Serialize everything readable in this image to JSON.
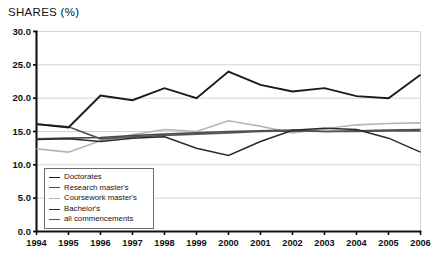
{
  "chart_title": "SHARES (%)",
  "axes": {
    "y_ticks": [
      "0.0",
      "5.0",
      "10.0",
      "15.0",
      "20.0",
      "25.0",
      "30.0"
    ],
    "x_ticks": [
      "1994",
      "1995",
      "1996",
      "1997",
      "1998",
      "1999",
      "2000",
      "2001",
      "2002",
      "2003",
      "2004",
      "2005",
      "2006"
    ]
  },
  "legend": {
    "items": [
      {
        "label": "Doctorates",
        "color": "#1a1a1a",
        "width": 1.9
      },
      {
        "label": "Research master's",
        "color": "#4a4a4a",
        "width": 1.7
      },
      {
        "label": "Coursework master's",
        "color": "#b4b4b4",
        "width": 1.6
      },
      {
        "label": "Bachelor's",
        "color": "#2b2b2b",
        "width": 1.5
      },
      {
        "label": "all commencements",
        "color": "#545454",
        "width": 1.6
      }
    ]
  },
  "chart_data": {
    "type": "line",
    "title": "SHARES (%)",
    "xlabel": "",
    "ylabel": "SHARES (%)",
    "ylim": [
      0.0,
      30.0
    ],
    "ytick_step": 5.0,
    "grid": true,
    "legend_position": "inside-lower-left",
    "categories": [
      "1994",
      "1995",
      "1996",
      "1997",
      "1998",
      "1999",
      "2000",
      "2001",
      "2002",
      "2003",
      "2004",
      "2005",
      "2006"
    ],
    "series": [
      {
        "name": "Doctorates",
        "color": "#1a1a1a",
        "width": 1.9,
        "values": [
          16.1,
          15.6,
          20.4,
          19.7,
          21.5,
          20.0,
          24.0,
          22.0,
          21.0,
          21.5,
          20.3,
          20.0,
          23.5
        ]
      },
      {
        "name": "Research master's",
        "color": "#4a4a4a",
        "width": 1.7,
        "values": [
          13.9,
          14.0,
          14.1,
          14.4,
          14.6,
          14.8,
          15.0,
          15.1,
          15.2,
          15.0,
          15.1,
          15.2,
          15.3
        ]
      },
      {
        "name": "Coursework master's",
        "color": "#b4b4b4",
        "width": 1.6,
        "values": [
          12.4,
          11.9,
          13.6,
          14.5,
          15.3,
          15.0,
          16.6,
          15.8,
          14.8,
          15.4,
          16.0,
          16.2,
          16.3
        ]
      },
      {
        "name": "Bachelor's",
        "color": "#2b2b2b",
        "width": 1.5,
        "values": [
          13.8,
          13.9,
          13.5,
          14.0,
          14.2,
          12.5,
          11.4,
          13.5,
          15.2,
          15.5,
          15.3,
          14.0,
          11.9
        ]
      },
      {
        "name": "all commencements",
        "color": "#545454",
        "width": 1.6,
        "values": [
          16.1,
          15.7,
          13.9,
          14.2,
          14.4,
          14.6,
          14.8,
          15.0,
          15.1,
          15.0,
          15.0,
          15.1,
          15.1
        ]
      }
    ]
  }
}
